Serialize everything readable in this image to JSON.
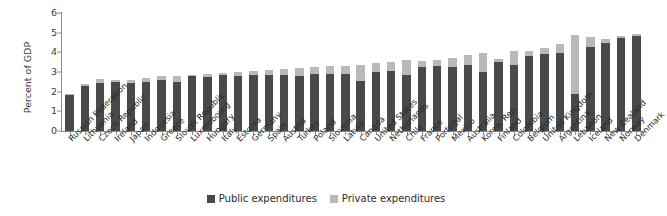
{
  "chart_data": {
    "type": "bar",
    "title": "",
    "subtitle": "",
    "xlabel": "",
    "ylabel": "Percent of GDP",
    "ylim": [
      0,
      6
    ],
    "yticks": [
      0,
      1,
      2,
      3,
      4,
      5,
      6
    ],
    "grid": false,
    "stacked": true,
    "legend_position": "bottom-center",
    "categories": [
      "Russian Federation",
      "Lithuania",
      "Czech Republic",
      "Ireland",
      "Japan",
      "Indonesia",
      "Greece",
      "Slovak Republic",
      "Luxembourg",
      "Hungary",
      "Italy",
      "Estonia",
      "Germany",
      "Spain",
      "Austria",
      "Turkey",
      "Poland",
      "Slovenia",
      "Latvia",
      "Canada",
      "United States",
      "Netherlands",
      "Chile",
      "France",
      "Portugal",
      "Mexico",
      "Australia",
      "Korea, Rep.",
      "Finland",
      "Colombia",
      "Belgium",
      "United Kingdom",
      "Argentina",
      "Lebanon",
      "Iceland",
      "New Zealand",
      "Norway",
      "Denmark"
    ],
    "series": [
      {
        "name": "Public expenditures",
        "color": "#494949",
        "values": [
          1.85,
          2.3,
          2.45,
          2.5,
          2.45,
          2.5,
          2.6,
          2.5,
          2.8,
          2.75,
          2.85,
          2.8,
          2.85,
          2.85,
          2.85,
          2.8,
          2.9,
          2.9,
          2.9,
          2.55,
          3.0,
          3.05,
          2.85,
          3.25,
          3.3,
          3.25,
          3.35,
          3.0,
          3.5,
          3.35,
          3.8,
          3.9,
          3.95,
          1.9,
          4.25,
          4.5,
          4.75,
          4.85
        ]
      },
      {
        "name": "Private expenditures",
        "color": "#b9b9b9",
        "values": [
          0.05,
          0.1,
          0.2,
          0.1,
          0.15,
          0.2,
          0.2,
          0.3,
          0.05,
          0.15,
          0.1,
          0.2,
          0.2,
          0.25,
          0.3,
          0.4,
          0.35,
          0.4,
          0.4,
          0.8,
          0.45,
          0.45,
          0.75,
          0.3,
          0.3,
          0.45,
          0.5,
          0.95,
          0.15,
          0.7,
          0.25,
          0.3,
          0.45,
          3.0,
          0.55,
          0.2,
          0.1,
          0.1
        ]
      }
    ],
    "legend": [
      {
        "label": "Public expenditures",
        "color": "#494949"
      },
      {
        "label": "Private expenditures",
        "color": "#b9b9b9"
      }
    ]
  }
}
